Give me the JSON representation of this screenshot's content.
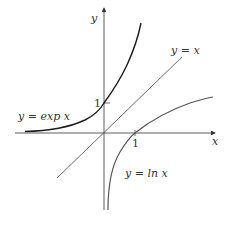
{
  "figure": {
    "axes": {
      "x_label": "x",
      "y_label": "y",
      "x_tick": "1",
      "y_tick": "1"
    },
    "curves": {
      "exp_label": "y = exp x",
      "identity_label": "y = x",
      "ln_label": "y = ln x"
    },
    "colors": {
      "axis": "#333333",
      "exp": "#1a1a1a",
      "identity": "#444444",
      "ln": "#555555"
    }
  }
}
